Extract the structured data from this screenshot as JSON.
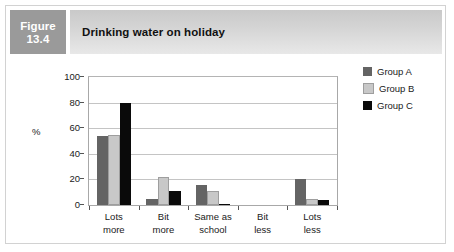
{
  "figure": {
    "number_label_line1": "Figure",
    "number_label_line2": "13.4",
    "title": "Drinking water on holiday"
  },
  "legend": {
    "position": "right",
    "entries": [
      {
        "label": "Group A",
        "color": "#646464"
      },
      {
        "label": "Group B",
        "color": "#c8c8c8"
      },
      {
        "label": "Group C",
        "color": "#0a0a0a"
      }
    ]
  },
  "axis": {
    "y_title": "%",
    "y_ticks": [
      "0",
      "20",
      "40",
      "60",
      "80",
      "100"
    ]
  },
  "chart_data": {
    "type": "bar",
    "title": "Drinking water on holiday",
    "xlabel": "",
    "ylabel": "%",
    "ylim": [
      0,
      100
    ],
    "ytick_interval": 20,
    "grid": true,
    "legend_position": "right",
    "categories": [
      "Lots more",
      "Bit more",
      "Same as school",
      "Bit less",
      "Lots less"
    ],
    "category_lines": [
      [
        "Lots",
        "more"
      ],
      [
        "Bit",
        "more"
      ],
      [
        "Same as",
        "school"
      ],
      [
        "Bit",
        "less"
      ],
      [
        "Lots",
        "less"
      ]
    ],
    "series": [
      {
        "name": "Group A",
        "color": "#646464",
        "values": [
          54,
          5,
          16,
          0,
          20
        ]
      },
      {
        "name": "Group B",
        "color": "#c8c8c8",
        "values": [
          55,
          22,
          11,
          0,
          5
        ]
      },
      {
        "name": "Group C",
        "color": "#0a0a0a",
        "values": [
          80,
          11,
          1,
          0,
          4
        ]
      }
    ]
  }
}
